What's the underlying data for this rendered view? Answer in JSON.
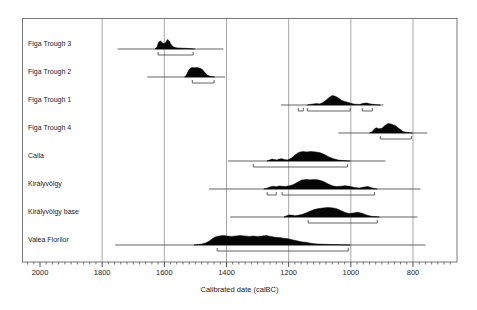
{
  "figure": {
    "xlabel": "Calibrated date (calBC)",
    "colors": {
      "ink": "#050505",
      "range_line": "#3c3c3c",
      "bracket": "#3c3c3c",
      "grid": "#909090",
      "frame": "#787878",
      "axis": "#3c3c3c",
      "background": "#ffffff"
    }
  },
  "chart_data": {
    "type": "area",
    "title": "",
    "xlabel": "Calibrated date (calBC)",
    "x_ticks": [
      2000,
      1800,
      1600,
      1400,
      1200,
      1000,
      800
    ],
    "x_minor_tick_step": 20,
    "x_domain": [
      2058,
      657
    ],
    "x_axis_reversed": true,
    "gridlines_at": [
      1800,
      1600,
      1400,
      1200,
      1000,
      800
    ],
    "rows": [
      {
        "label": "Figa Trough 3",
        "range_line_calBC": [
          1750,
          1410
        ],
        "brackets_calBC": [
          [
            1620,
            1507
          ]
        ],
        "distribution_calBC": [
          [
            1630,
            0
          ],
          [
            1624,
            0.2
          ],
          [
            1618,
            0.75
          ],
          [
            1612,
            0.85
          ],
          [
            1607,
            0.65
          ],
          [
            1601,
            0.55
          ],
          [
            1596,
            0.7
          ],
          [
            1590,
            1.0
          ],
          [
            1584,
            0.85
          ],
          [
            1578,
            0.45
          ],
          [
            1570,
            0.2
          ],
          [
            1558,
            0.12
          ],
          [
            1540,
            0.08
          ],
          [
            1520,
            0.05
          ],
          [
            1502,
            0
          ]
        ]
      },
      {
        "label": "Figa Trough 2",
        "range_line_calBC": [
          1655,
          1405
        ],
        "brackets_calBC": [
          [
            1510,
            1440
          ]
        ],
        "distribution_calBC": [
          [
            1535,
            0
          ],
          [
            1530,
            0.15
          ],
          [
            1525,
            0.5
          ],
          [
            1519,
            0.85
          ],
          [
            1512,
            1.0
          ],
          [
            1504,
            0.97
          ],
          [
            1496,
            1.0
          ],
          [
            1487,
            0.95
          ],
          [
            1478,
            0.8
          ],
          [
            1470,
            0.5
          ],
          [
            1463,
            0.2
          ],
          [
            1452,
            0.07
          ],
          [
            1438,
            0
          ]
        ]
      },
      {
        "label": "Figa Trough 1",
        "range_line_calBC": [
          1225,
          895
        ],
        "brackets_calBC": [
          [
            1169,
            1153
          ],
          [
            1140,
            1002
          ],
          [
            963,
            931
          ]
        ],
        "distribution_calBC": [
          [
            1140,
            0
          ],
          [
            1130,
            0.06
          ],
          [
            1120,
            0.12
          ],
          [
            1110,
            0.15
          ],
          [
            1100,
            0.12
          ],
          [
            1090,
            0.25
          ],
          [
            1080,
            0.5
          ],
          [
            1070,
            0.8
          ],
          [
            1060,
            1.0
          ],
          [
            1050,
            0.92
          ],
          [
            1040,
            0.75
          ],
          [
            1030,
            0.5
          ],
          [
            1020,
            0.38
          ],
          [
            1010,
            0.3
          ],
          [
            1000,
            0.18
          ],
          [
            988,
            0.08
          ],
          [
            972,
            0.06
          ],
          [
            960,
            0.18
          ],
          [
            948,
            0.2
          ],
          [
            936,
            0.1
          ],
          [
            920,
            0.03
          ],
          [
            905,
            0
          ]
        ]
      },
      {
        "label": "Figa Trough 4",
        "range_line_calBC": [
          1040,
          754
        ],
        "brackets_calBC": [
          [
            905,
            805
          ]
        ],
        "distribution_calBC": [
          [
            940,
            0
          ],
          [
            932,
            0.12
          ],
          [
            925,
            0.4
          ],
          [
            918,
            0.55
          ],
          [
            910,
            0.45
          ],
          [
            900,
            0.5
          ],
          [
            890,
            0.8
          ],
          [
            880,
            1.0
          ],
          [
            870,
            0.95
          ],
          [
            858,
            0.8
          ],
          [
            846,
            0.5
          ],
          [
            832,
            0.15
          ],
          [
            818,
            0.05
          ],
          [
            802,
            0
          ]
        ]
      },
      {
        "label": "Caila",
        "range_line_calBC": [
          1395,
          889
        ],
        "brackets_calBC": [
          [
            1314,
            1011
          ]
        ],
        "distribution_calBC": [
          [
            1270,
            0
          ],
          [
            1262,
            0.1
          ],
          [
            1254,
            0.2
          ],
          [
            1246,
            0.16
          ],
          [
            1238,
            0.1
          ],
          [
            1230,
            0.2
          ],
          [
            1222,
            0.24
          ],
          [
            1214,
            0.16
          ],
          [
            1204,
            0.12
          ],
          [
            1192,
            0.3
          ],
          [
            1180,
            0.62
          ],
          [
            1168,
            0.9
          ],
          [
            1155,
            1.0
          ],
          [
            1142,
            0.96
          ],
          [
            1128,
            1.0
          ],
          [
            1114,
            0.96
          ],
          [
            1100,
            0.88
          ],
          [
            1086,
            0.7
          ],
          [
            1072,
            0.45
          ],
          [
            1058,
            0.25
          ],
          [
            1040,
            0.1
          ],
          [
            1020,
            0.04
          ],
          [
            1002,
            0
          ]
        ]
      },
      {
        "label": "Királyvölgy",
        "range_line_calBC": [
          1456,
          776
        ],
        "brackets_calBC": [
          [
            1269,
            1240
          ],
          [
            1221,
            924
          ]
        ],
        "distribution_calBC": [
          [
            1280,
            0
          ],
          [
            1270,
            0.08
          ],
          [
            1260,
            0.22
          ],
          [
            1250,
            0.3
          ],
          [
            1240,
            0.24
          ],
          [
            1230,
            0.32
          ],
          [
            1220,
            0.28
          ],
          [
            1210,
            0.26
          ],
          [
            1198,
            0.34
          ],
          [
            1186,
            0.45
          ],
          [
            1172,
            0.7
          ],
          [
            1158,
            0.95
          ],
          [
            1144,
            1.0
          ],
          [
            1130,
            0.97
          ],
          [
            1116,
            1.0
          ],
          [
            1102,
            0.94
          ],
          [
            1088,
            0.8
          ],
          [
            1074,
            0.55
          ],
          [
            1060,
            0.35
          ],
          [
            1046,
            0.25
          ],
          [
            1032,
            0.3
          ],
          [
            1018,
            0.35
          ],
          [
            1004,
            0.28
          ],
          [
            988,
            0.15
          ],
          [
            972,
            0.1
          ],
          [
            958,
            0.2
          ],
          [
            945,
            0.25
          ],
          [
            932,
            0.12
          ],
          [
            915,
            0
          ]
        ]
      },
      {
        "label": "Királyvölgy base",
        "range_line_calBC": [
          1388,
          786
        ],
        "brackets_calBC": [
          [
            1137,
            915
          ]
        ],
        "distribution_calBC": [
          [
            1215,
            0
          ],
          [
            1208,
            0.12
          ],
          [
            1200,
            0.2
          ],
          [
            1190,
            0.2
          ],
          [
            1180,
            0.14
          ],
          [
            1170,
            0.18
          ],
          [
            1158,
            0.26
          ],
          [
            1146,
            0.4
          ],
          [
            1132,
            0.6
          ],
          [
            1118,
            0.78
          ],
          [
            1104,
            0.88
          ],
          [
            1090,
            0.95
          ],
          [
            1076,
            1.0
          ],
          [
            1062,
            0.97
          ],
          [
            1048,
            0.9
          ],
          [
            1034,
            0.7
          ],
          [
            1020,
            0.5
          ],
          [
            1006,
            0.36
          ],
          [
            992,
            0.42
          ],
          [
            978,
            0.5
          ],
          [
            964,
            0.4
          ],
          [
            950,
            0.22
          ],
          [
            934,
            0.08
          ],
          [
            908,
            0
          ]
        ]
      },
      {
        "label": "Valea Florilor",
        "range_line_calBC": [
          1758,
          760
        ],
        "brackets_calBC": [
          [
            1430,
            1008
          ]
        ],
        "distribution_calBC": [
          [
            1505,
            0
          ],
          [
            1492,
            0.05
          ],
          [
            1480,
            0.1
          ],
          [
            1468,
            0.2
          ],
          [
            1456,
            0.4
          ],
          [
            1446,
            0.65
          ],
          [
            1436,
            0.85
          ],
          [
            1424,
            0.95
          ],
          [
            1412,
            1.0
          ],
          [
            1398,
            0.94
          ],
          [
            1384,
            0.9
          ],
          [
            1370,
            0.95
          ],
          [
            1356,
            1.0
          ],
          [
            1342,
            0.96
          ],
          [
            1328,
            0.9
          ],
          [
            1314,
            0.94
          ],
          [
            1300,
            0.9
          ],
          [
            1286,
            0.94
          ],
          [
            1272,
            1.0
          ],
          [
            1258,
            0.9
          ],
          [
            1244,
            0.82
          ],
          [
            1230,
            0.78
          ],
          [
            1216,
            0.72
          ],
          [
            1202,
            0.66
          ],
          [
            1188,
            0.55
          ],
          [
            1174,
            0.45
          ],
          [
            1160,
            0.35
          ],
          [
            1146,
            0.28
          ],
          [
            1132,
            0.2
          ],
          [
            1118,
            0.14
          ],
          [
            1104,
            0.1
          ],
          [
            1085,
            0.07
          ],
          [
            1060,
            0.05
          ],
          [
            1035,
            0.03
          ],
          [
            1002,
            0
          ]
        ]
      }
    ]
  }
}
